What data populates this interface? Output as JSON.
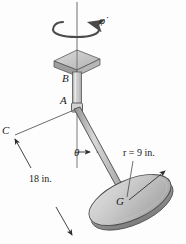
{
  "figure": {
    "labels": {
      "point_b": "B",
      "point_a": "A",
      "point_c": "C",
      "point_g": "G",
      "angle_theta": "θ",
      "spin_rate": "φ̇",
      "length_dimension": "18 in.",
      "radius_dimension": "r = 9 in."
    },
    "colors": {
      "outline": "#3a3a3a",
      "disk_fill": "#b9b9b9",
      "disk_top": "#cfcfcf",
      "plate_fill": "#b4b4b4",
      "plate_top": "#cccccc",
      "rod_fill": "#c8c8c8",
      "background": "#fdfdfd"
    },
    "geometry": {
      "axis_x": 77,
      "axis_top_y": 2,
      "plate_center": [
        77,
        62
      ],
      "point_b": [
        77,
        78
      ],
      "point_a": [
        77,
        107
      ],
      "point_g": [
        128,
        202
      ],
      "point_c": [
        14,
        140
      ],
      "disk_center": [
        130,
        200
      ],
      "disk_rx": 44,
      "disk_ry": 20,
      "disk_rotation_deg": -24,
      "theta_deg": 28,
      "radius_tip": [
        167,
        169
      ]
    },
    "icons": {
      "spin_arrow": "circular-arrow-icon",
      "dimension_arrow": "double-arrow-icon",
      "radius_arrow": "single-arrow-icon"
    }
  }
}
